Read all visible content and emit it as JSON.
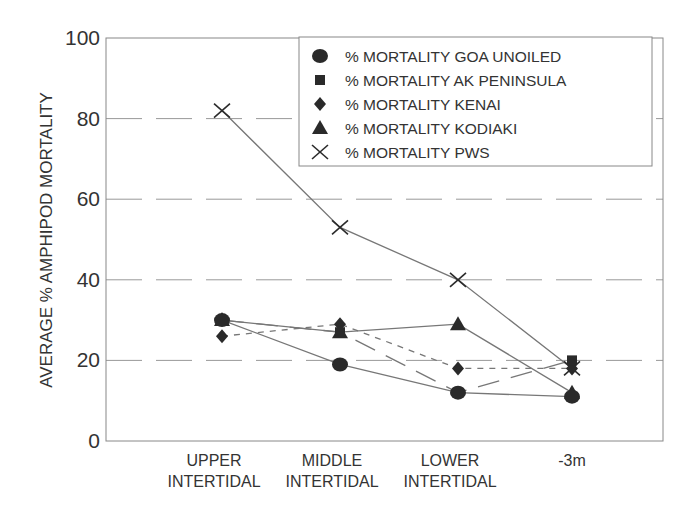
{
  "chart_data": {
    "type": "line",
    "title": "",
    "xlabel": "",
    "ylabel": "AVERAGE % AMPHIPOD MORTALITY",
    "ylim": [
      0,
      100
    ],
    "yticks": [
      0,
      20,
      40,
      60,
      80,
      100
    ],
    "grid": "dashed horizontal at 20, 40, 60, 80",
    "legend_position": "upper right (inside plot)",
    "categories": [
      [
        "UPPER",
        "INTERTIDAL"
      ],
      [
        "MIDDLE",
        "INTERTIDAL"
      ],
      [
        "LOWER",
        "INTERTIDAL"
      ],
      [
        "-3m"
      ]
    ],
    "series": [
      {
        "name": "% MORTALITY GOA UNOILED",
        "marker": "circle",
        "line": "solid",
        "values": [
          30,
          19,
          12,
          11
        ]
      },
      {
        "name": "% MORTALITY AK PENINSULA",
        "marker": "square",
        "line": "longdash",
        "values": [
          30,
          27,
          12,
          20
        ]
      },
      {
        "name": "% MORTALITY KENAI",
        "marker": "diamond",
        "line": "shortdash",
        "values": [
          26,
          29,
          18,
          18
        ]
      },
      {
        "name": "% MORTALITY KODIAKI",
        "marker": "triangle",
        "line": "solid",
        "values": [
          30,
          27,
          29,
          12
        ]
      },
      {
        "name": "% MORTALITY PWS",
        "marker": "x",
        "line": "solid",
        "values": [
          82,
          53,
          40,
          18
        ]
      }
    ]
  },
  "colors": {
    "axis": "#888888",
    "grid": "#999999",
    "series_line": "#777777",
    "marker": "#2a2a2a",
    "text": "#333333"
  }
}
